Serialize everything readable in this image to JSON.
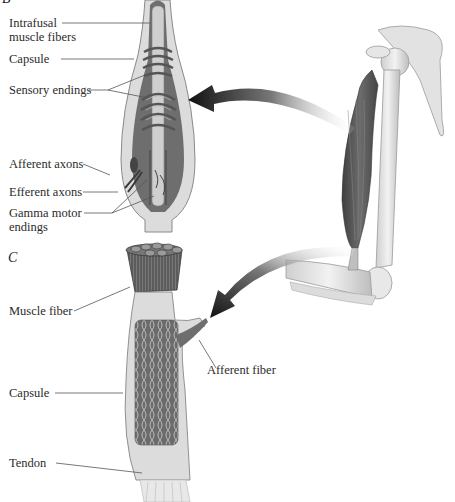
{
  "panels": {
    "b": {
      "letter": "B",
      "title": "Muscle spindle",
      "labels": {
        "intrafusal_1": "Intrafusal",
        "intrafusal_2": "muscle fibers",
        "capsule": "Capsule",
        "sensory_endings": "Sensory endings",
        "afferent_axons": "Afferent axons",
        "efferent_axons": "Efferent axons",
        "gamma_1": "Gamma motor",
        "gamma_2": "endings"
      }
    },
    "c": {
      "letter": "C",
      "title": "Golgi tendon organ",
      "labels": {
        "muscle_fiber": "Muscle fiber",
        "afferent_fiber": "Afferent fiber",
        "capsule": "Capsule",
        "tendon": "Tendon"
      }
    },
    "arm": {
      "description": "Upper arm with biceps muscle, humerus, scapula and forearm bones",
      "arrows": [
        "spindle-callout-arrow",
        "tendon-organ-callout-arrow"
      ]
    }
  },
  "colors": {
    "capsule_fill": "#d9d9d9",
    "capsule_stroke": "#8a8a8a",
    "inner_dark": "#6e6e6e",
    "muscle": "#5a5a5a",
    "bone": "#e6e6e6",
    "arrow": "#1a1a1a"
  }
}
